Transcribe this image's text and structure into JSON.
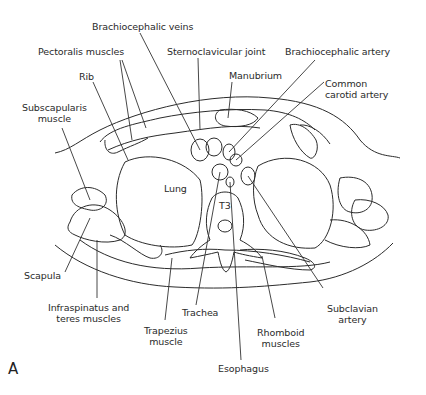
{
  "figure": {
    "panel_label": "A",
    "labels": {
      "brachiocephalic_veins": "Brachiocephalic veins",
      "pectoralis_muscles": "Pectoralis muscles",
      "sternoclavicular_joint": "Sternoclavicular joint",
      "brachiocephalic_artery": "Brachiocephalic artery",
      "rib": "Rib",
      "manubrium": "Manubrium",
      "common_carotid_line1": "Common",
      "common_carotid_line2": "carotid artery",
      "subscapularis_line1": "Subscapularis",
      "subscapularis_line2": "muscle",
      "lung": "Lung",
      "t3": "T3",
      "scapula": "Scapula",
      "infraspinatus_line1": "Infraspinatus and",
      "infraspinatus_line2": "teres muscles",
      "trachea": "Trachea",
      "subclavian_line1": "Subclavian",
      "subclavian_line2": "artery",
      "trapezius_line1": "Trapezius",
      "trapezius_line2": "muscle",
      "rhomboid_line1": "Rhomboid",
      "rhomboid_line2": "muscles",
      "esophagus": "Esophagus"
    }
  }
}
